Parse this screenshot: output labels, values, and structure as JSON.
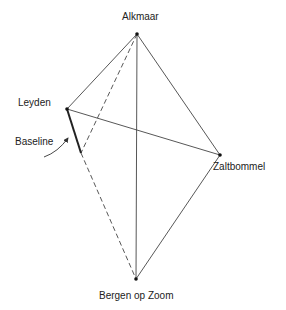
{
  "diagram": {
    "type": "triangulation",
    "nodes": [
      {
        "id": "alkmaar",
        "label": "Alkmaar",
        "x": 137,
        "y": 34
      },
      {
        "id": "leyden",
        "label": "Leyden",
        "x": 67,
        "y": 109
      },
      {
        "id": "zaltbommel",
        "label": "Zaltbommel",
        "x": 220,
        "y": 155
      },
      {
        "id": "bergen",
        "label": "Bergen op Zoom",
        "x": 136,
        "y": 279
      },
      {
        "id": "baseline_end",
        "label": "",
        "x": 81,
        "y": 153
      }
    ],
    "edges": [
      {
        "from": "alkmaar",
        "to": "leyden",
        "style": "solid"
      },
      {
        "from": "alkmaar",
        "to": "zaltbommel",
        "style": "solid"
      },
      {
        "from": "alkmaar",
        "to": "bergen",
        "style": "solid"
      },
      {
        "from": "leyden",
        "to": "zaltbommel",
        "style": "solid"
      },
      {
        "from": "zaltbommel",
        "to": "bergen",
        "style": "solid"
      },
      {
        "from": "leyden",
        "to": "baseline_end",
        "style": "bold"
      },
      {
        "from": "alkmaar",
        "to": "baseline_end",
        "style": "dashed"
      },
      {
        "from": "baseline_end",
        "to": "bergen",
        "style": "dashed"
      }
    ],
    "annotation": {
      "label": "Baseline",
      "points_to": "leyden-baseline_end"
    },
    "colors": {
      "line": "#333333",
      "text": "#222222",
      "background": "#ffffff"
    }
  },
  "labels": {
    "alkmaar": "Alkmaar",
    "leyden": "Leyden",
    "zaltbommel": "Zaltbommel",
    "bergen": "Bergen op Zoom",
    "baseline": "Baseline"
  }
}
